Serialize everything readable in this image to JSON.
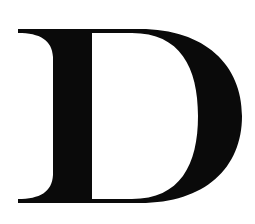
{
  "glyph": {
    "character": "D",
    "color": "#0a0a0a",
    "background": "#ffffff"
  }
}
